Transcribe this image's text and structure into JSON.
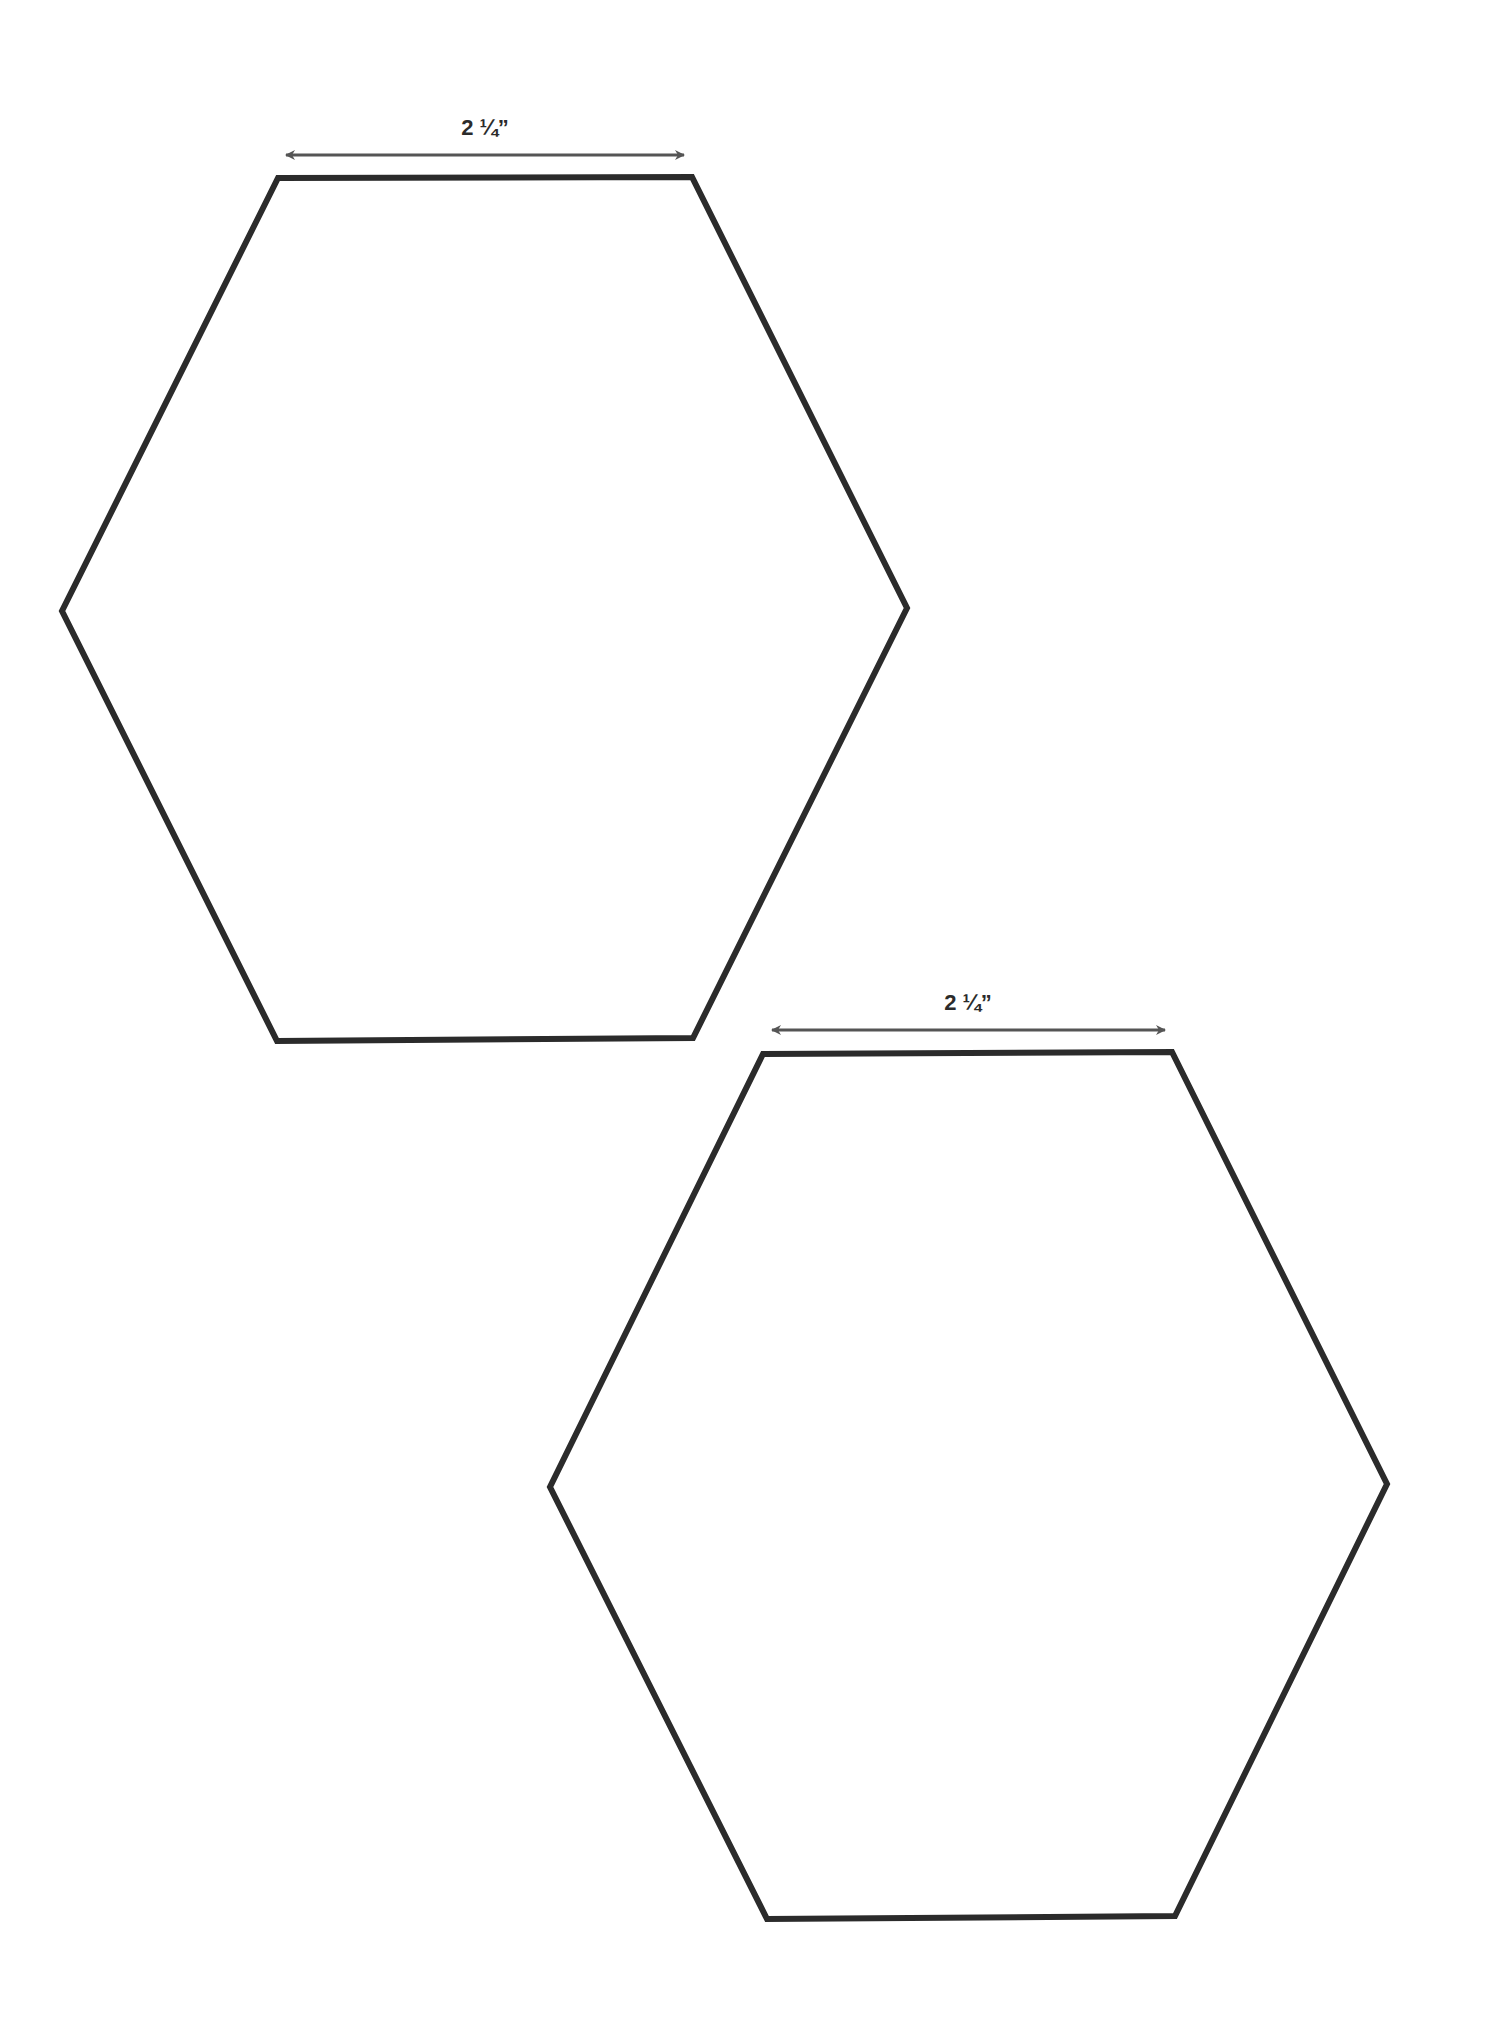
{
  "page": {
    "background": "#ffffff"
  },
  "colors": {
    "outline": "#2b2b2b",
    "dimension_arrow": "#555555",
    "label": "#2b2b2b"
  },
  "hexagons": [
    {
      "id": "hexagon-1",
      "side_label": "2 ¼”",
      "points": [
        [
          278,
          178
        ],
        [
          692,
          177
        ],
        [
          907,
          608
        ],
        [
          693,
          1038
        ],
        [
          277,
          1041
        ],
        [
          62,
          611
        ]
      ],
      "dimension": {
        "x1": 286,
        "x2": 684,
        "y": 155,
        "label_x": 485,
        "label_y": 135
      }
    },
    {
      "id": "hexagon-2",
      "side_label": "2 ¼”",
      "points": [
        [
          763,
          1054
        ],
        [
          1172,
          1052
        ],
        [
          1387,
          1484
        ],
        [
          1175,
          1916
        ],
        [
          767,
          1919
        ],
        [
          550,
          1487
        ]
      ],
      "dimension": {
        "x1": 772,
        "x2": 1165,
        "y": 1030,
        "label_x": 968,
        "label_y": 1010
      }
    }
  ]
}
